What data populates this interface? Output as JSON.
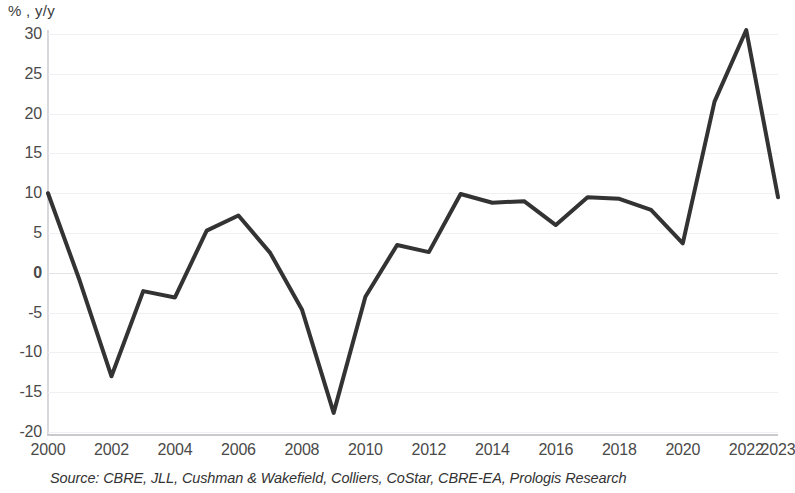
{
  "chart_data": {
    "type": "line",
    "title": "",
    "subtitle": "",
    "xlabel": "",
    "ylabel": "% , y/y",
    "ylim": [
      -20,
      30
    ],
    "xlim": [
      2000,
      2023
    ],
    "grid": true,
    "legend": null,
    "y_ticks": [
      30,
      25,
      20,
      15,
      10,
      5,
      0,
      -5,
      -10,
      -15,
      -20
    ],
    "y_tick_labels": [
      "30",
      "25",
      "20",
      "15",
      "10",
      "5",
      "0",
      "-5",
      "-10",
      "-15",
      "-20"
    ],
    "x_ticks": [
      2000,
      2002,
      2004,
      2006,
      2008,
      2010,
      2012,
      2014,
      2016,
      2018,
      2020,
      2022,
      2023
    ],
    "x_tick_labels": [
      "2000",
      "2002",
      "2004",
      "2006",
      "2008",
      "2010",
      "2012",
      "2014",
      "2016",
      "2018",
      "2020",
      "2022",
      "2023"
    ],
    "x": [
      2000,
      2001,
      2002,
      2003,
      2004,
      2005,
      2006,
      2007,
      2008,
      2009,
      2010,
      2011,
      2012,
      2013,
      2014,
      2015,
      2016,
      2017,
      2018,
      2019,
      2020,
      2021,
      2022,
      2023
    ],
    "series": [
      {
        "name": "",
        "color": "#333333",
        "line_width": 4,
        "values": [
          10.0,
          -1.0,
          -13.0,
          -2.3,
          -3.1,
          5.3,
          7.2,
          2.5,
          -4.6,
          -17.6,
          -3.0,
          3.5,
          2.6,
          9.9,
          8.8,
          9.0,
          6.0,
          9.5,
          9.3,
          7.9,
          3.7,
          21.5,
          30.5,
          9.5
        ]
      }
    ]
  },
  "axis": {
    "y_unit_label": "% , y/y"
  },
  "footer": {
    "source": "Source: CBRE, JLL, Cushman & Wakefield, Colliers, CoStar, CBRE-EA, Prologis Research"
  }
}
